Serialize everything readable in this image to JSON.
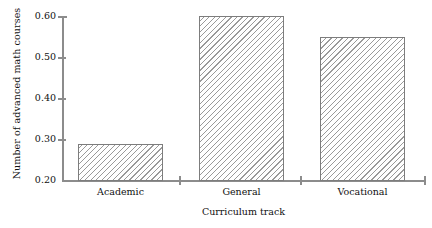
{
  "chart_data": {
    "type": "bar",
    "title": "",
    "subtitle": "",
    "categories": [
      "Academic",
      "General",
      "Vocational"
    ],
    "values": [
      0.29,
      0.6,
      0.55
    ],
    "xlabel": "Curriculum track",
    "ylabel": "Number of advanced math courses",
    "ylim": [
      0.2,
      0.6
    ],
    "yticks": [
      "0.60",
      "0.50",
      "0.40",
      "0.30",
      "0.20"
    ],
    "ytick_values": [
      0.6,
      0.5,
      0.4,
      0.3,
      0.2
    ],
    "grid": false,
    "legend": false,
    "legend_position": "none",
    "bar_fill": "hatched-45",
    "bar_edge_color": "#7d7d7d",
    "hatch_color": "#9a9a9a",
    "axis_color": "#8c8c8c",
    "background": "#ffffff"
  },
  "axes": {
    "y_label": "Number of advanced math courses",
    "x_label": "Curriculum track",
    "y_ticks": [
      {
        "label": "0.60",
        "value": 0.6
      },
      {
        "label": "0.50",
        "value": 0.5
      },
      {
        "label": "0.40",
        "value": 0.4
      },
      {
        "label": "0.30",
        "value": 0.3
      },
      {
        "label": "0.20",
        "value": 0.2
      }
    ],
    "x_categories": [
      {
        "label": "Academic",
        "value": 0.29
      },
      {
        "label": "General",
        "value": 0.6
      },
      {
        "label": "Vocational",
        "value": 0.55
      }
    ]
  }
}
